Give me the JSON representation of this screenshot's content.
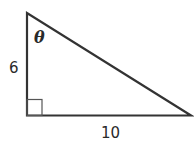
{
  "diagram": {
    "type": "right-triangle",
    "vertical_side_label": "6",
    "horizontal_side_label": "10",
    "angle_label": "θ",
    "right_angle_marker": true,
    "stroke_color": "#333333"
  }
}
